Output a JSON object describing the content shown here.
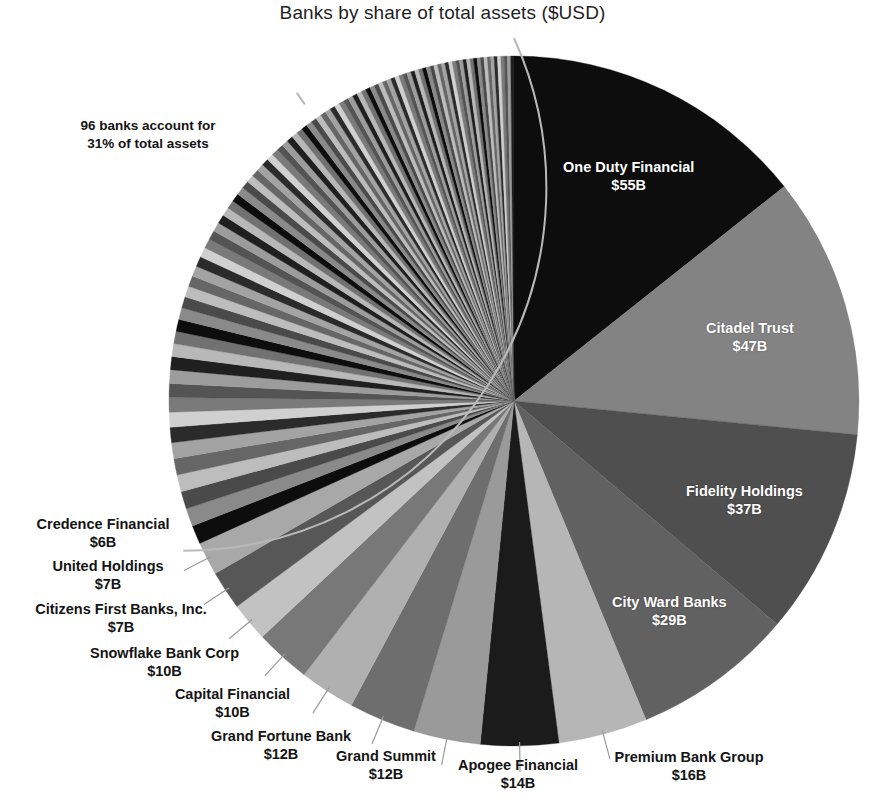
{
  "chart_data": {
    "type": "pie",
    "title": "Banks by share of total assets ($USD)",
    "unit": "$B",
    "value_suffix": "B",
    "value_prefix": "$",
    "start_angle_deg": 0,
    "direction": "clockwise",
    "legend": "none",
    "grid": false,
    "annotation": {
      "line1": "96 banks account for",
      "line2": "31% of total assets",
      "banks_count": 96,
      "share_percent": 31
    },
    "labeled_slices": [
      {
        "name": "One Duty Financial",
        "value": 55,
        "value_label": "$55B",
        "color": "#0d0d0d",
        "label_position": "inside"
      },
      {
        "name": "Citadel Trust",
        "value": 47,
        "value_label": "$47B",
        "color": "#838383",
        "label_position": "inside"
      },
      {
        "name": "Fidelity Holdings",
        "value": 37,
        "value_label": "$37B",
        "color": "#4f4f4f",
        "label_position": "inside"
      },
      {
        "name": "City Ward Banks",
        "value": 29,
        "value_label": "$29B",
        "color": "#616161",
        "label_position": "inside"
      },
      {
        "name": "Premium Bank Group",
        "value": 16,
        "value_label": "$16B",
        "color": "#b6b6b6",
        "label_position": "outside"
      },
      {
        "name": "Apogee Financial",
        "value": 14,
        "value_label": "$14B",
        "color": "#1b1b1b",
        "label_position": "outside"
      },
      {
        "name": "Grand Summit",
        "value": 12,
        "value_label": "$12B",
        "color": "#9a9a9a",
        "label_position": "outside"
      },
      {
        "name": "Grand Fortune Bank",
        "value": 12,
        "value_label": "$12B",
        "color": "#6e6e6e",
        "label_position": "outside"
      },
      {
        "name": "Capital Financial",
        "value": 10,
        "value_label": "$10B",
        "color": "#b0b0b0",
        "label_position": "outside"
      },
      {
        "name": "Snowflake Bank Corp",
        "value": 10,
        "value_label": "$10B",
        "color": "#787878",
        "label_position": "outside"
      },
      {
        "name": "Citizens First Banks, Inc.",
        "value": 7,
        "value_label": "$7B",
        "color": "#c2c2c2",
        "label_position": "outside"
      },
      {
        "name": "United Holdings",
        "value": 7,
        "value_label": "$7B",
        "color": "#575757",
        "label_position": "outside"
      },
      {
        "name": "Credence Financial",
        "value": 6,
        "value_label": "$6B",
        "color": "#a8a8a8",
        "label_position": "outside"
      }
    ],
    "unlabeled_group": {
      "description": "96 remaining banks, unlabeled thin slices",
      "count": 96,
      "total_value": 122,
      "share_percent": 31
    },
    "palette": [
      "#0d0d0d",
      "#8a8a8a",
      "#4a4a4a",
      "#bdbdbd",
      "#666666",
      "#a3a3a3",
      "#2b2b2b",
      "#d0d0d0",
      "#7a7a7a",
      "#545454",
      "#9c9c9c",
      "#1f1f1f",
      "#b8b8b8",
      "#717171"
    ]
  },
  "inner_labels": [
    {
      "name": "One Duty Financial",
      "value_label": "$55B",
      "x": 563,
      "y": 159,
      "align": "left"
    },
    {
      "name": "Citadel Trust",
      "value_label": "$47B",
      "x": 706,
      "y": 320,
      "align": "left"
    },
    {
      "name": "Fidelity Holdings",
      "value_label": "$37B",
      "x": 686,
      "y": 483,
      "align": "left"
    },
    {
      "name": "City Ward Banks",
      "value_label": "$29B",
      "x": 612,
      "y": 594,
      "align": "left"
    }
  ],
  "outer_labels": [
    {
      "name": "Premium Bank Group",
      "value_label": "$16B",
      "x": 599,
      "y": 749,
      "align": "left",
      "width": 180
    },
    {
      "name": "Apogee Financial",
      "value_label": "$14B",
      "x": 443,
      "y": 757,
      "align": "left",
      "width": 150
    },
    {
      "name": "Grand Summit",
      "value_label": "$12B",
      "x": 322,
      "y": 748,
      "align": "left",
      "width": 128
    },
    {
      "name": "Grand Fortune Bank",
      "value_label": "$12B",
      "x": 196,
      "y": 728,
      "align": "left",
      "width": 170
    },
    {
      "name": "Capital Financial",
      "value_label": "$10B",
      "x": 162,
      "y": 686,
      "align": "left",
      "width": 141
    },
    {
      "name": "Snowflake Bank Corp",
      "value_label": "$10B",
      "x": 74,
      "y": 645,
      "align": "left",
      "width": 181
    },
    {
      "name": "Citizens First Banks, Inc.",
      "value_label": "$7B",
      "x": 14,
      "y": 601,
      "align": "left",
      "width": 214
    },
    {
      "name": "United Holdings",
      "value_label": "$7B",
      "x": 28,
      "y": 558,
      "align": "left",
      "width": 160
    },
    {
      "name": "Credence Financial",
      "value_label": "$6B",
      "x": 19,
      "y": 516,
      "align": "left",
      "width": 168
    }
  ],
  "annotation_position": {
    "x": 38,
    "y": 117,
    "width": 220
  }
}
